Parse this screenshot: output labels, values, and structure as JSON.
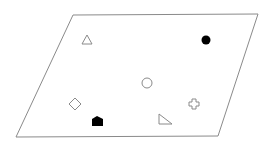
{
  "diagram": {
    "stroke_color": "#8a8a8a",
    "fill_color": "#000000",
    "background": "#ffffff",
    "plane": {
      "shape": "parallelogram",
      "points": [
        [
          73,
          15
        ],
        [
          258,
          14
        ],
        [
          218,
          136
        ],
        [
          16,
          137
        ]
      ]
    },
    "shapes": [
      {
        "name": "triangle-outline",
        "type": "triangle",
        "style": "outline",
        "cx": 87,
        "cy": 41
      },
      {
        "name": "circle-filled",
        "type": "circle",
        "style": "filled",
        "cx": 206,
        "cy": 40
      },
      {
        "name": "circle-outline",
        "type": "circle",
        "style": "outline",
        "cx": 147,
        "cy": 83
      },
      {
        "name": "diamond-outline",
        "type": "diamond",
        "style": "outline",
        "cx": 75,
        "cy": 104
      },
      {
        "name": "cross-outline",
        "type": "cross",
        "style": "outline",
        "cx": 194,
        "cy": 104
      },
      {
        "name": "pentagon-filled",
        "type": "house-pentagon",
        "style": "filled",
        "cx": 97,
        "cy": 121
      },
      {
        "name": "right-triangle-outline",
        "type": "right-triangle",
        "style": "outline",
        "cx": 164,
        "cy": 120
      }
    ]
  }
}
